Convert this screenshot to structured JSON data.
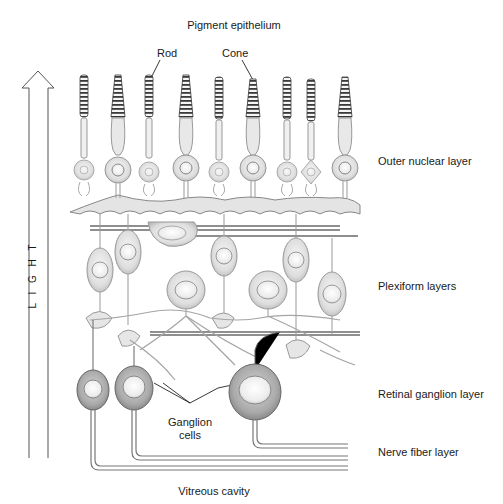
{
  "diagram": {
    "top_label": "Pigment epithelium",
    "bottom_label": "Vitreous cavity",
    "light_arrow_label": "L I G H T",
    "photoreceptor_labels": {
      "rod": "Rod",
      "cone": "Cone"
    },
    "layer_labels": {
      "outer_nuclear": "Outer nuclear layer",
      "plexiform": "Plexiform layers",
      "retinal_ganglion": "Retinal ganglion layer",
      "nerve_fiber": "Nerve fiber layer"
    },
    "ganglion_label_line1": "Ganglion",
    "ganglion_label_line2": "cells",
    "photoreceptors": [
      {
        "type": "rod",
        "x": 84
      },
      {
        "type": "cone",
        "x": 118
      },
      {
        "type": "rod",
        "x": 149
      },
      {
        "type": "cone",
        "x": 186
      },
      {
        "type": "rod",
        "x": 219
      },
      {
        "type": "cone",
        "x": 253
      },
      {
        "type": "rod",
        "x": 287
      },
      {
        "type": "rod",
        "x": 311
      },
      {
        "type": "cone",
        "x": 345
      }
    ],
    "colors": {
      "line": "#555555",
      "cell_fill": "#e6e6e6",
      "cell_dark": "#9a9a9a",
      "nucleus": "#f4f4f4",
      "text": "#1a1a1a"
    }
  }
}
